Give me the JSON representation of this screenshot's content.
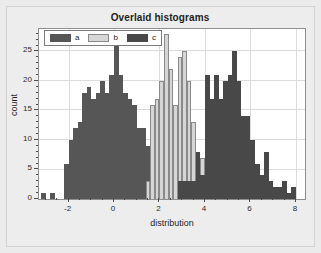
{
  "chart_data": {
    "type": "bar",
    "title": "Overlaid histograms",
    "xlabel": "distribution",
    "ylabel": "count",
    "xlim": [
      -3.3,
      8.4
    ],
    "ylim": [
      0,
      28.8
    ],
    "xticks": [
      -2,
      0,
      2,
      4,
      6,
      8
    ],
    "yticks": [
      0,
      5,
      10,
      15,
      20,
      25
    ],
    "grid": true,
    "legend_position": "upper left",
    "bin_width": 0.2,
    "series": [
      {
        "name": "a",
        "color": "#565656",
        "bins": [
          -3.1,
          -2.9,
          -2.7,
          -2.5,
          -2.3,
          -2.1,
          -1.9,
          -1.7,
          -1.5,
          -1.3,
          -1.1,
          -0.9,
          -0.7,
          -0.5,
          -0.3,
          -0.1,
          0.1,
          0.3,
          0.5,
          0.7,
          0.9,
          1.1,
          1.3,
          1.5,
          1.7,
          1.9,
          2.1,
          2.3,
          2.5
        ],
        "values": [
          1,
          0,
          1,
          0,
          0,
          6,
          10,
          12,
          13,
          18,
          19,
          17,
          18,
          20,
          18,
          21,
          28,
          21,
          18,
          17,
          16,
          12,
          12,
          9,
          5,
          3,
          2,
          2,
          1
        ]
      },
      {
        "name": "b",
        "color": "#d6d6d6",
        "bins": [
          1.5,
          1.7,
          1.9,
          2.1,
          2.3,
          2.5,
          2.7,
          2.9,
          3.1,
          3.3,
          3.5,
          3.7,
          3.9,
          4.1,
          4.3
        ],
        "values": [
          3,
          16,
          17,
          20,
          28,
          22,
          16,
          24,
          25,
          20,
          13,
          8,
          7,
          2,
          2
        ]
      },
      {
        "name": "c",
        "color": "#484848",
        "bins": [
          2.9,
          3.1,
          3.3,
          3.5,
          3.7,
          3.9,
          4.1,
          4.3,
          4.5,
          4.7,
          4.9,
          5.1,
          5.3,
          5.5,
          5.7,
          5.9,
          6.1,
          6.3,
          6.5,
          6.7,
          6.9,
          7.1,
          7.3,
          7.5,
          7.7,
          7.9
        ],
        "values": [
          3,
          3,
          3,
          3,
          8,
          4,
          21,
          17,
          21,
          17,
          20,
          21,
          25,
          20,
          14,
          14,
          10,
          6,
          4,
          8,
          3,
          2,
          2,
          3,
          1,
          2
        ]
      }
    ]
  },
  "legend": {
    "entries": [
      {
        "label": "a",
        "color": "#565656"
      },
      {
        "label": "b",
        "color": "#d6d6d6"
      },
      {
        "label": "c",
        "color": "#484848"
      }
    ]
  }
}
